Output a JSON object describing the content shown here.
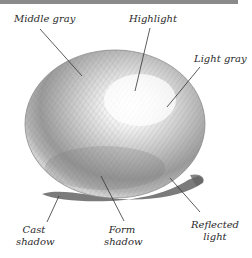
{
  "figure": {
    "labels": {
      "middle_gray": "Middle gray",
      "highlight": "Highlight",
      "light_gray": "Light gray",
      "cast_shadow_l1": "Cast",
      "cast_shadow_l2": "shadow",
      "form_shadow_l1": "Form",
      "form_shadow_l2": "shadow",
      "reflected_light_l1": "Reflected",
      "reflected_light_l2": "light"
    },
    "colors": {
      "topbar": "#8a8a8a",
      "text": "#2a2a2a",
      "leader_line": "#333333"
    }
  }
}
